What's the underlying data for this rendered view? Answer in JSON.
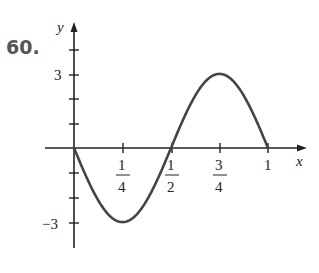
{
  "problem": {
    "number": "60."
  },
  "chart_data": {
    "type": "line",
    "title": "",
    "xlabel": "x",
    "ylabel": "y",
    "x_ticks": [
      {
        "value": 0.25,
        "num": "1",
        "den": "4"
      },
      {
        "value": 0.5,
        "num": "1",
        "den": "2"
      },
      {
        "value": 0.75,
        "num": "3",
        "den": "4"
      },
      {
        "value": 1,
        "label": "1"
      }
    ],
    "y_ticks": [
      {
        "value": 3,
        "label": "3"
      },
      {
        "value": -3,
        "label": "−3"
      }
    ],
    "y_minor_ticks": [
      4,
      3,
      2,
      1,
      -1,
      -2,
      -3
    ],
    "xlim": [
      -0.3,
      1.2
    ],
    "ylim": [
      -4,
      5
    ],
    "series": [
      {
        "name": "y = -3 sin(2πx)",
        "function": "-3*sin(2*pi*x)",
        "domain": [
          0,
          1
        ],
        "x": [
          0,
          0.125,
          0.25,
          0.375,
          0.5,
          0.625,
          0.75,
          0.875,
          1
        ],
        "y": [
          0,
          -2.12,
          -3,
          -2.12,
          0,
          2.12,
          3,
          2.12,
          0
        ]
      }
    ],
    "grid": false,
    "legend": "none"
  },
  "colors": {
    "axis": "#222222",
    "curve": "#444444",
    "number": "#555555"
  }
}
